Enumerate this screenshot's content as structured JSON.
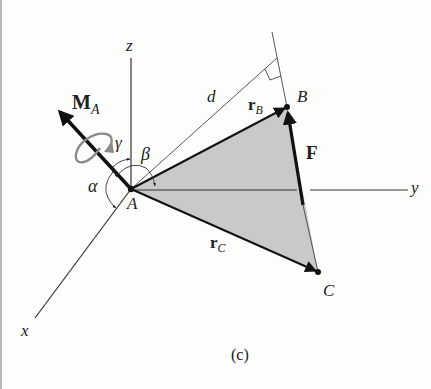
{
  "figure": {
    "caption": "(c)",
    "axes": {
      "x": "x",
      "y": "y",
      "z": "z"
    },
    "points": {
      "A": "A",
      "B": "B",
      "C": "C"
    },
    "vectors": {
      "moment": {
        "main": "M",
        "sub": "A"
      },
      "force": "F",
      "rB": {
        "main": "r",
        "sub": "B"
      },
      "rC": {
        "main": "r",
        "sub": "C"
      }
    },
    "distance": "d",
    "angles": {
      "alpha": "α",
      "beta": "β",
      "gamma": "γ"
    },
    "colors": {
      "line": "#222222",
      "plane_fill": "#c9c9c9",
      "moment_circle": "#8a8a8a",
      "background": "#fdfdfc"
    }
  }
}
